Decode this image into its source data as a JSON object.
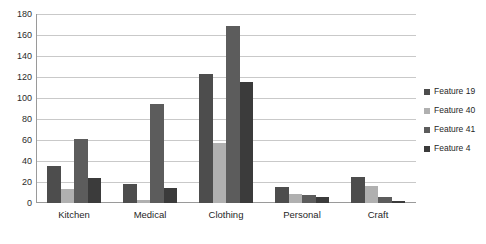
{
  "chart_data": {
    "type": "bar",
    "title": "",
    "subtitle": "",
    "xlabel": "",
    "ylabel": "",
    "categories": [
      "Kitchen",
      "Medical",
      "Clothing",
      "Personal",
      "Craft"
    ],
    "series": [
      {
        "name": "Feature 19",
        "color": "#4d4d4d",
        "values": [
          35,
          18,
          123,
          15,
          25
        ]
      },
      {
        "name": "Feature 40",
        "color": "#b0b0b0",
        "values": [
          13,
          3,
          57,
          9,
          16
        ]
      },
      {
        "name": "Feature 41",
        "color": "#5c5c5c",
        "values": [
          61,
          94,
          169,
          8,
          6
        ]
      },
      {
        "name": "Feature 4",
        "color": "#3b3b3b",
        "values": [
          24,
          14,
          115,
          6,
          2
        ]
      }
    ],
    "ylim": [
      0,
      180
    ],
    "ytick_step": 20,
    "yticks": [
      "180",
      "160",
      "140",
      "120",
      "100",
      "80",
      "60",
      "40",
      "20",
      "0"
    ],
    "grid": "horizontal",
    "legend_position": "right",
    "axis_color": "#9a9a9a",
    "grid_color": "#c9c9c9",
    "background": "#ffffff"
  }
}
